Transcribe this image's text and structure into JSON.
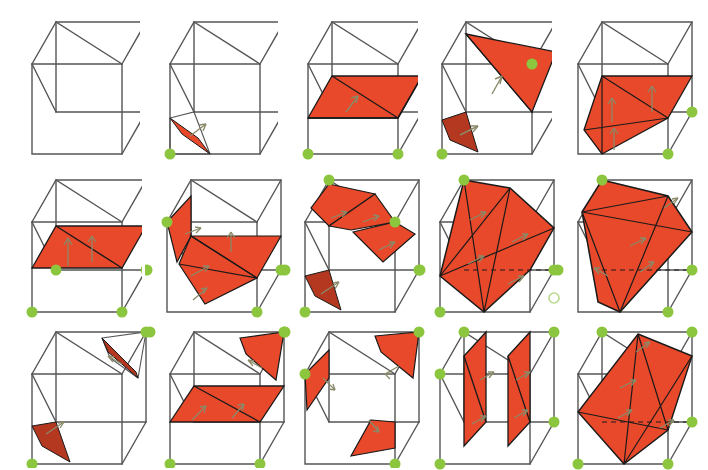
{
  "figure": {
    "background_color": "#ffffff",
    "rows": 3,
    "columns": 5,
    "palette": {
      "plane_fill": "#e8492a",
      "plane_fill_dark": "#b4371f",
      "plane_edge": "#1a1a1a",
      "cube_edge": "#555555",
      "cube_edge_hidden": "#6a6a6a",
      "lattice_point": "#8cc63e",
      "lattice_point_open": "#b9d98a",
      "arrow": "#8a8a6a"
    },
    "legend": {
      "plane_label": "lattice plane",
      "point_label": "lattice point",
      "arrow_label": "plane normal"
    }
  },
  "cells": [
    {
      "index": 1,
      "row": 1,
      "col": 1,
      "name": "cell-r1c1",
      "planes": 0,
      "points": 0,
      "arrows": 0,
      "caption": "empty cube"
    },
    {
      "index": 2,
      "row": 1,
      "col": 2,
      "name": "cell-r1c2",
      "planes": 1,
      "points": 1,
      "arrows": 1,
      "caption": "single edge-on sliver plane, front-bottom-left corner"
    },
    {
      "index": 3,
      "row": 1,
      "col": 3,
      "name": "cell-r1c3",
      "planes": 1,
      "points": 2,
      "arrows": 1,
      "caption": "horizontal rhombus plane across lower cube"
    },
    {
      "index": 4,
      "row": 1,
      "col": 4,
      "name": "cell-r1c4",
      "planes": 2,
      "points": 2,
      "arrows": 2,
      "caption": "large upper triangle plus lower sliver"
    },
    {
      "index": 5,
      "row": 1,
      "col": 5,
      "name": "cell-r1c5",
      "planes": 1,
      "points": 2,
      "arrows": 3,
      "caption": "tilted quadrilateral plane"
    },
    {
      "index": 6,
      "row": 2,
      "col": 1,
      "name": "cell-r2c1",
      "planes": 1,
      "points": 4,
      "arrows": 2,
      "caption": "horizontal mid-height rhombus"
    },
    {
      "index": 7,
      "row": 2,
      "col": 2,
      "name": "cell-r2c2",
      "planes": 3,
      "points": 4,
      "arrows": 4,
      "caption": "corner triangle, mid rhombus and tilted triangle"
    },
    {
      "index": 8,
      "row": 2,
      "col": 3,
      "name": "cell-r2c3",
      "planes": 4,
      "points": 4,
      "arrows": 4,
      "caption": "three upper triangles plus one sliver"
    },
    {
      "index": 9,
      "row": 2,
      "col": 4,
      "name": "cell-r2c4",
      "planes": 1,
      "points": 4,
      "arrows": 4,
      "caption": "large hexagonal section through cube centre",
      "open_point": true
    },
    {
      "index": 10,
      "row": 2,
      "col": 5,
      "name": "cell-r2c5",
      "planes": 1,
      "points": 4,
      "arrows": 3,
      "caption": "irregular polygon section"
    },
    {
      "index": 11,
      "row": 3,
      "col": 1,
      "name": "cell-r3c1",
      "planes": 2,
      "points": 2,
      "arrows": 2,
      "caption": "two opposite corner slivers"
    },
    {
      "index": 12,
      "row": 3,
      "col": 2,
      "name": "cell-r3c2",
      "planes": 2,
      "points": 3,
      "arrows": 3,
      "caption": "upper corner sliver and lower rhombus"
    },
    {
      "index": 13,
      "row": 3,
      "col": 3,
      "name": "cell-r3c3",
      "planes": 3,
      "points": 3,
      "arrows": 3,
      "caption": "three corner triangles"
    },
    {
      "index": 14,
      "row": 3,
      "col": 4,
      "name": "cell-r3c4",
      "planes": 2,
      "points": 4,
      "arrows": 4,
      "caption": "two parallel vertical planes"
    },
    {
      "index": 15,
      "row": 3,
      "col": 5,
      "name": "cell-r3c5",
      "planes": 1,
      "points": 4,
      "arrows": 4,
      "caption": "large tilted quadrilateral section"
    }
  ]
}
